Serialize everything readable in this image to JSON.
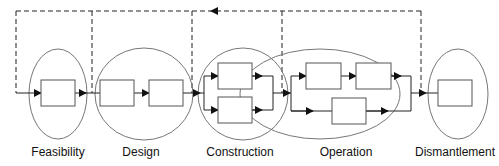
{
  "diagram": {
    "type": "lifecycle-flow",
    "phases": [
      {
        "id": "feasibility",
        "label": "Feasibility",
        "cx": 58,
        "rx": 29,
        "boxes": 1
      },
      {
        "id": "design",
        "label": "Design",
        "cx": 144,
        "rx": 49,
        "boxes": 2
      },
      {
        "id": "construction",
        "label": "Construction",
        "cx": 243,
        "rx": 45,
        "boxes": 2
      },
      {
        "id": "operation",
        "label": "Operation",
        "cx": 320,
        "rx": 80,
        "boxes": 3
      },
      {
        "id": "dismantlement",
        "label": "Dismantlement",
        "cx": 458,
        "rx": 30,
        "boxes": 1
      }
    ],
    "feedback": {
      "style": "dashed",
      "direction": "right-to-left",
      "description": "Dashed feedback loop from end of Operation back to start of each earlier phase"
    },
    "colors": {
      "line": "#222222",
      "ellipse": "#666666",
      "box": "#555555"
    }
  }
}
